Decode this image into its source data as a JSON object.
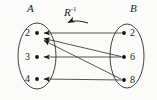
{
  "figure": {
    "type": "arrow-diagram",
    "title": "",
    "relation_label": "R",
    "relation_exponent": "-1",
    "direction_note": "arrows point from B to A"
  },
  "sets": {
    "left": {
      "name": "A",
      "elements": [
        "2",
        "3",
        "4"
      ]
    },
    "right": {
      "name": "B",
      "elements": [
        "2",
        "6",
        "8"
      ]
    }
  },
  "mappings": [
    {
      "from": "2",
      "to": "2"
    },
    {
      "from": "6",
      "to": "2"
    },
    {
      "from": "6",
      "to": "3"
    },
    {
      "from": "8",
      "to": "2"
    },
    {
      "from": "8",
      "to": "4"
    }
  ],
  "colors": {
    "ink": "#1a1a1a",
    "stroke": "#2b2b2b",
    "paper": "#fbfbfa"
  }
}
